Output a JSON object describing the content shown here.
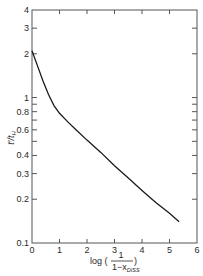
{
  "chart_data": {
    "type": "line",
    "title": "",
    "xlabel": "log (1 / (1 − x_DISS))",
    "ylabel": "t′/t_H",
    "xlabel_parts": {
      "prefix": "log (",
      "numerator": "1",
      "denominator": "1−x",
      "denominator_sub": "DISS",
      "suffix": ")"
    },
    "ylabel_parts": {
      "main": "t′/t",
      "sub": "H"
    },
    "xlim": [
      0,
      6
    ],
    "ylim": [
      0.1,
      4
    ],
    "yscale": "log",
    "grid": false,
    "legend": null,
    "x_ticks": [
      0,
      1,
      2,
      3,
      4,
      5,
      6
    ],
    "x_tick_labels": [
      "0",
      "1",
      "2",
      "3",
      "4",
      "5",
      "6"
    ],
    "y_ticks": [
      0.1,
      0.2,
      0.3,
      0.4,
      0.5,
      0.6,
      0.7,
      0.8,
      0.9,
      1,
      2,
      3,
      4
    ],
    "y_tick_labels": [
      {
        "value": 0.1,
        "label": "0.1"
      },
      {
        "value": 0.2,
        "label": "0.2"
      },
      {
        "value": 0.3,
        "label": "0.3"
      },
      {
        "value": 0.4,
        "label": "0.4"
      },
      {
        "value": 0.6,
        "label": "0.6"
      },
      {
        "value": 0.8,
        "label": "0.8"
      },
      {
        "value": 1,
        "label": "1"
      },
      {
        "value": 2,
        "label": "2"
      },
      {
        "value": 3,
        "label": "3"
      },
      {
        "value": 4,
        "label": "4"
      }
    ],
    "series": [
      {
        "name": "t′/t_H",
        "x": [
          0.0,
          0.2,
          0.4,
          0.6,
          0.8,
          1.0,
          1.3,
          1.6,
          2.0,
          2.5,
          3.0,
          3.5,
          4.0,
          4.5,
          5.0,
          5.35
        ],
        "y": [
          2.1,
          1.65,
          1.3,
          1.05,
          0.88,
          0.78,
          0.68,
          0.6,
          0.51,
          0.42,
          0.34,
          0.28,
          0.23,
          0.19,
          0.16,
          0.14
        ]
      }
    ]
  }
}
